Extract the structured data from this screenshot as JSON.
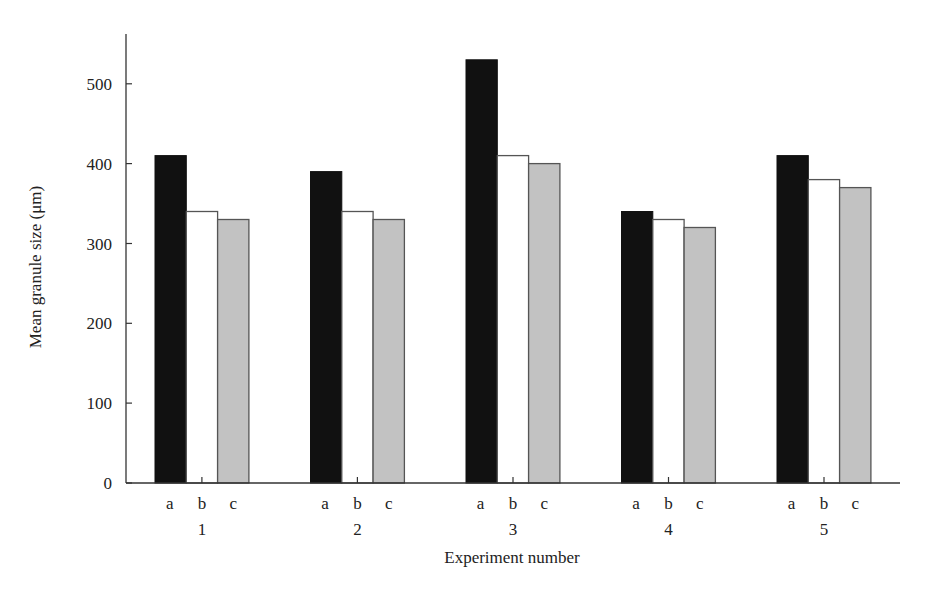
{
  "chart_data": {
    "type": "bar",
    "title": "",
    "xlabel": "Experiment number",
    "ylabel": "Mean granule size (μm)",
    "ylim": [
      0,
      560
    ],
    "yticks": [
      0,
      100,
      200,
      300,
      400,
      500
    ],
    "grid": false,
    "legend": null,
    "categories": [
      "1",
      "2",
      "3",
      "4",
      "5"
    ],
    "subcategories": [
      "a",
      "b",
      "c"
    ],
    "series": [
      {
        "name": "a",
        "color": "#111111",
        "values": [
          410,
          390,
          530,
          340,
          410
        ]
      },
      {
        "name": "b",
        "color": "#ffffff",
        "values": [
          340,
          340,
          410,
          330,
          380
        ]
      },
      {
        "name": "c",
        "color": "#c2c2c2",
        "values": [
          330,
          330,
          400,
          320,
          370
        ]
      }
    ]
  }
}
